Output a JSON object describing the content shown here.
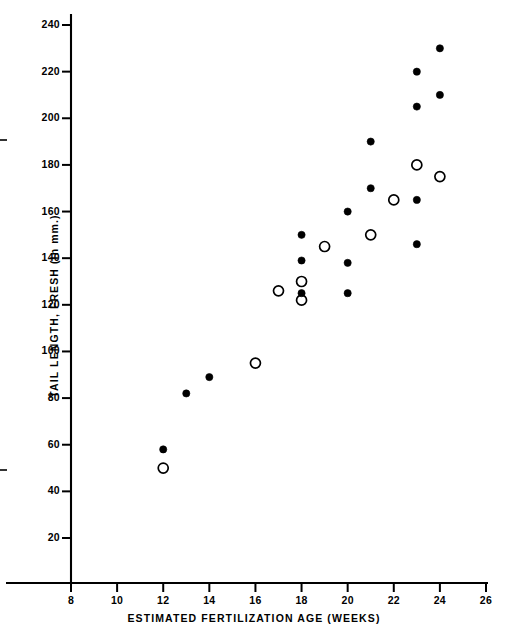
{
  "chart_data": {
    "type": "scatter",
    "title": "",
    "xlabel": "ESTIMATED FERTILIZATION AGE (WEEKS)",
    "ylabel": "TAIL LENGTH, FRESH (In mm.)",
    "xlim": [
      8,
      26
    ],
    "ylim": [
      0,
      240
    ],
    "xticks": [
      8,
      10,
      12,
      14,
      16,
      18,
      20,
      22,
      24,
      26
    ],
    "xtick_labels": [
      "8",
      "10",
      "12",
      "14",
      "16",
      "18",
      "20",
      "22",
      "24",
      "26"
    ],
    "yticks": [
      20,
      40,
      60,
      80,
      100,
      120,
      140,
      160,
      180,
      200,
      220,
      240
    ],
    "ytick_labels": [
      "20",
      "40",
      "60",
      "80",
      "100",
      "120",
      "140",
      "160",
      "180",
      "200",
      "220",
      "240"
    ],
    "grid": false,
    "legend": "none",
    "marker_styles": {
      "filled": "filled-circle",
      "open": "open-circle"
    },
    "series": [
      {
        "name": "filled",
        "marker": "filled-circle",
        "points": [
          {
            "x": 12,
            "y": 58
          },
          {
            "x": 13,
            "y": 82
          },
          {
            "x": 14,
            "y": 89
          },
          {
            "x": 18,
            "y": 150
          },
          {
            "x": 18,
            "y": 139
          },
          {
            "x": 18,
            "y": 125
          },
          {
            "x": 20,
            "y": 160
          },
          {
            "x": 20,
            "y": 138
          },
          {
            "x": 20,
            "y": 125
          },
          {
            "x": 21,
            "y": 190
          },
          {
            "x": 21,
            "y": 170
          },
          {
            "x": 23,
            "y": 220
          },
          {
            "x": 23,
            "y": 205
          },
          {
            "x": 23,
            "y": 165
          },
          {
            "x": 23,
            "y": 146
          },
          {
            "x": 24,
            "y": 230
          },
          {
            "x": 24,
            "y": 210
          }
        ]
      },
      {
        "name": "open",
        "marker": "open-circle",
        "points": [
          {
            "x": 12,
            "y": 50
          },
          {
            "x": 16,
            "y": 95
          },
          {
            "x": 17,
            "y": 126
          },
          {
            "x": 18,
            "y": 130
          },
          {
            "x": 18,
            "y": 122
          },
          {
            "x": 19,
            "y": 145
          },
          {
            "x": 21,
            "y": 150
          },
          {
            "x": 22,
            "y": 165
          },
          {
            "x": 23,
            "y": 180
          },
          {
            "x": 24,
            "y": 175
          }
        ]
      }
    ]
  },
  "figure": {
    "caption_text": ""
  }
}
